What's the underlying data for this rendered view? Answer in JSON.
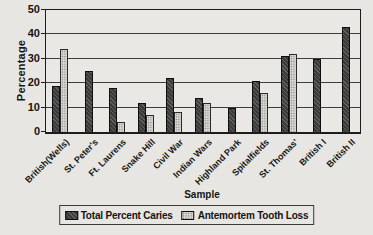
{
  "chart_data": {
    "type": "bar",
    "title": "",
    "xlabel": "Sample",
    "ylabel": "Percentage",
    "ylim": [
      0,
      50
    ],
    "yticks": [
      0,
      10,
      20,
      30,
      40,
      50
    ],
    "grid": true,
    "legend_position": "bottom",
    "categories": [
      "British(Wells)",
      "St. Peter's",
      "Ft. Laurens",
      "Snake Hill",
      "Civil War",
      "Indian Wars",
      "Highland Park",
      "Spitalfields",
      "St. Thomas'",
      "British I",
      "British II"
    ],
    "series": [
      {
        "name": "Total Percent Caries",
        "color": "#3a3a3a",
        "pattern": "solid-dark",
        "values": [
          19,
          25,
          18,
          12,
          22,
          14,
          10,
          21,
          31,
          30,
          43
        ]
      },
      {
        "name": "Antemortem Tooth Loss",
        "color": "#d9d7d3",
        "pattern": "dotted-light",
        "values": [
          34,
          null,
          4,
          7,
          8,
          12,
          null,
          16,
          32,
          null,
          null
        ]
      }
    ]
  },
  "colors": {
    "background": "#e8e6e2",
    "axis_line": "#1c1c1c",
    "gridline": "#3d3d3d",
    "text": "#141414"
  }
}
